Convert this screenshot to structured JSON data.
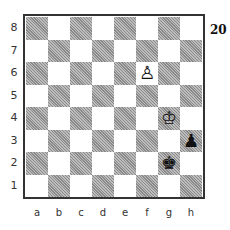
{
  "diagram": {
    "number": "20",
    "ranks": [
      "8",
      "7",
      "6",
      "5",
      "4",
      "3",
      "2",
      "1"
    ],
    "files": [
      "a",
      "b",
      "c",
      "d",
      "e",
      "f",
      "g",
      "h"
    ],
    "a1_color": "dark",
    "pieces": [
      {
        "square": "f6",
        "color": "white",
        "type": "pawn",
        "glyph": "♙"
      },
      {
        "square": "g4",
        "color": "white",
        "type": "king",
        "glyph": "♔"
      },
      {
        "square": "h3",
        "color": "black",
        "type": "pawn",
        "glyph": "♟"
      },
      {
        "square": "g2",
        "color": "black",
        "type": "king",
        "glyph": "♚"
      }
    ]
  }
}
